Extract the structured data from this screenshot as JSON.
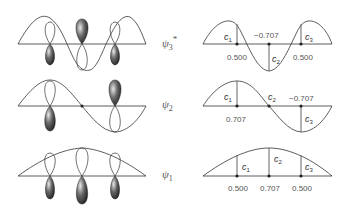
{
  "orbitals": [
    {
      "id": "psi3_star",
      "label": "ψ",
      "subscript": "3",
      "superscript": "*",
      "coefficients": [
        {
          "name": "C",
          "sub": "1",
          "value": "0.500"
        },
        {
          "name": "C",
          "sub": "2",
          "value": "-0.707"
        },
        {
          "name": "C",
          "sub": "3",
          "value": "0.500"
        }
      ]
    },
    {
      "id": "psi2",
      "label": "ψ",
      "subscript": "2",
      "superscript": "",
      "coefficients": [
        {
          "name": "C",
          "sub": "1",
          "value": "0.707"
        },
        {
          "name": "C",
          "sub": "2",
          "value": ""
        },
        {
          "name": "C",
          "sub": "3",
          "value": "-0.707"
        }
      ]
    },
    {
      "id": "psi1",
      "label": "ψ",
      "subscript": "1",
      "superscript": "",
      "coefficients": [
        {
          "name": "C",
          "sub": "1",
          "value": "0.500"
        },
        {
          "name": "C",
          "sub": "2",
          "value": "0.707"
        },
        {
          "name": "C",
          "sub": "3",
          "value": "0.500"
        }
      ]
    }
  ],
  "colors": {
    "line": "#333333",
    "lobe_dark": "#3a3a3a",
    "lobe_light": "#cfcfcf",
    "text": "#555555"
  }
}
